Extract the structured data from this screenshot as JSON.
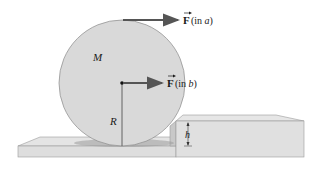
{
  "diagram": {
    "labels": {
      "mass": "M",
      "radius": "R",
      "height": "h",
      "force_a_symbol": "F",
      "force_a_paren_open": " (in ",
      "force_a_case": "a",
      "force_a_paren_close": ")",
      "force_b_symbol": "F",
      "force_b_paren_open": " (in ",
      "force_b_case": "b",
      "force_b_paren_close": ")"
    },
    "colors": {
      "wheel_fill": "#d9d9d9",
      "wheel_stroke": "#8a8a8a",
      "arrow": "#555555",
      "slab_top": "#e4e4e4",
      "slab_front": "#dcdcdc",
      "step_side": "#c8c8c8",
      "shadow": "#9a9a9a",
      "text": "#1a1a1a"
    },
    "elements": [
      {
        "id": "wheel",
        "type": "circle",
        "label": "M"
      },
      {
        "id": "force-a",
        "type": "arrow",
        "applied_at": "top of wheel",
        "label": "F (in a)"
      },
      {
        "id": "force-b",
        "type": "arrow",
        "applied_at": "center of wheel",
        "label": "F (in b)"
      },
      {
        "id": "radius-line",
        "type": "line",
        "label": "R"
      },
      {
        "id": "step",
        "type": "block",
        "label": "h"
      },
      {
        "id": "floor",
        "type": "slab"
      }
    ]
  }
}
